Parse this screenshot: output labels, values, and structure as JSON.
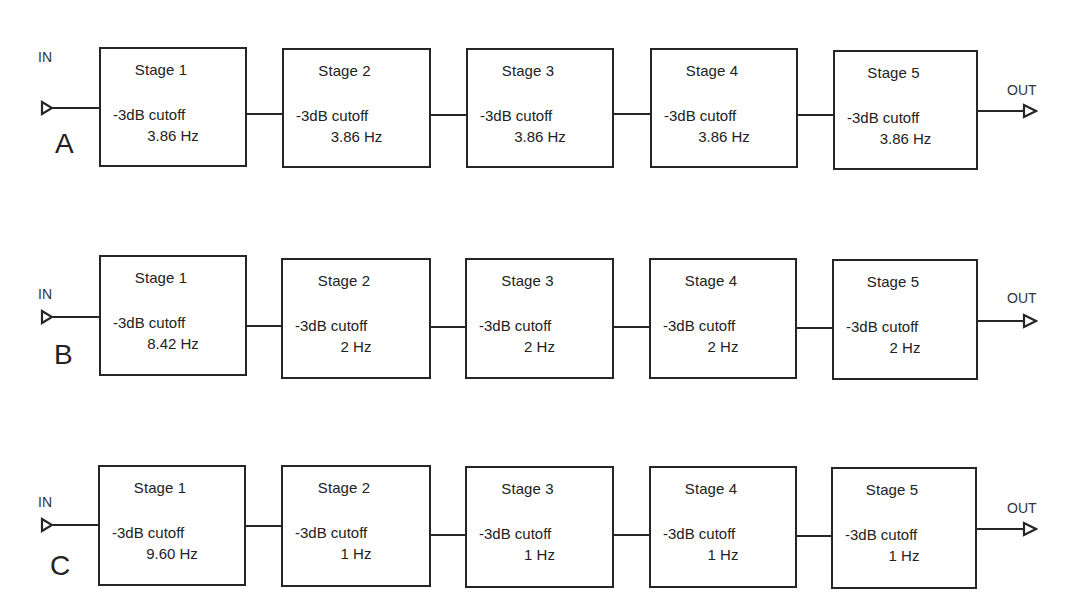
{
  "diagram": {
    "type": "cascaded filter stages block diagram",
    "input_label": "IN",
    "output_label": "OUT",
    "cutoff_label": "-3dB cutoff",
    "rows": [
      {
        "letter": "A",
        "stages": [
          {
            "name": "Stage 1",
            "cutoff": "3.86 Hz"
          },
          {
            "name": "Stage 2",
            "cutoff": "3.86 Hz"
          },
          {
            "name": "Stage 3",
            "cutoff": "3.86 Hz"
          },
          {
            "name": "Stage 4",
            "cutoff": "3.86 Hz"
          },
          {
            "name": "Stage 5",
            "cutoff": "3.86 Hz"
          }
        ]
      },
      {
        "letter": "B",
        "stages": [
          {
            "name": "Stage 1",
            "cutoff": "8.42 Hz"
          },
          {
            "name": "Stage 2",
            "cutoff": "2 Hz"
          },
          {
            "name": "Stage 3",
            "cutoff": "2 Hz"
          },
          {
            "name": "Stage 4",
            "cutoff": "2 Hz"
          },
          {
            "name": "Stage 5",
            "cutoff": "2 Hz"
          }
        ]
      },
      {
        "letter": "C",
        "stages": [
          {
            "name": "Stage 1",
            "cutoff": "9.60 Hz"
          },
          {
            "name": "Stage 2",
            "cutoff": "1 Hz"
          },
          {
            "name": "Stage 3",
            "cutoff": "1 Hz"
          },
          {
            "name": "Stage 4",
            "cutoff": "1 Hz"
          },
          {
            "name": "Stage 5",
            "cutoff": "1 Hz"
          }
        ]
      }
    ],
    "colors": {
      "line": "#262626",
      "background": "#ffffff",
      "text": "#222222"
    }
  }
}
